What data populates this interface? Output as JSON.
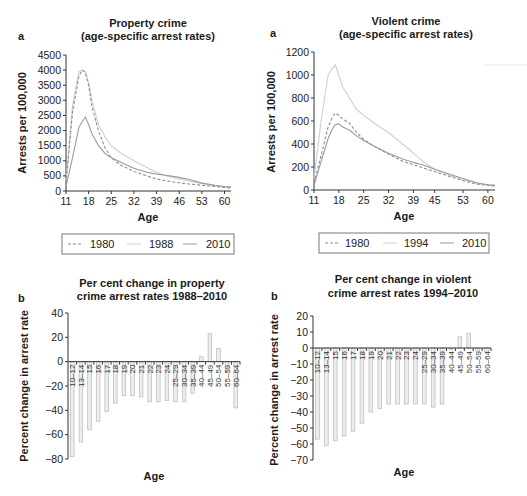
{
  "chart_data": [
    {
      "panel": "a",
      "type": "line",
      "title": "Property crime\n(age-specific arrest rates)",
      "title_lines": [
        "Property crime",
        "(age-specific arrest rates)"
      ],
      "xlabel": "Age",
      "ylabel": "Arrests per 100,000",
      "xlim": [
        11,
        62
      ],
      "ylim": [
        0,
        4500
      ],
      "xticks": [
        11,
        18,
        25,
        32,
        39,
        46,
        53,
        60
      ],
      "yticks": [
        0,
        500,
        1000,
        1500,
        2000,
        2500,
        3000,
        3500,
        4000,
        4500
      ],
      "grid": false,
      "legend_position": "bottom",
      "x": [
        11,
        13,
        15,
        16,
        17,
        18,
        19,
        21,
        23,
        25,
        28,
        32,
        36,
        39,
        42,
        46,
        49,
        53,
        57,
        60,
        62
      ],
      "series": [
        {
          "name": "1980",
          "style": "dashed",
          "color": "#8c8c8c",
          "values": [
            250,
            2600,
            3800,
            4000,
            3900,
            3500,
            2800,
            2000,
            1450,
            1100,
            850,
            650,
            500,
            400,
            330,
            270,
            230,
            190,
            150,
            120,
            100
          ]
        },
        {
          "name": "1988",
          "style": "solid-light",
          "color": "#c8c8c8",
          "values": [
            300,
            2800,
            3950,
            4000,
            3950,
            3600,
            3000,
            2200,
            1800,
            1500,
            1250,
            1000,
            780,
            620,
            500,
            400,
            330,
            250,
            180,
            140,
            120
          ]
        },
        {
          "name": "2010",
          "style": "solid",
          "color": "#9a9a9a",
          "values": [
            150,
            1100,
            2100,
            2300,
            2450,
            2200,
            1900,
            1500,
            1250,
            1100,
            950,
            750,
            620,
            560,
            520,
            450,
            380,
            260,
            190,
            150,
            130
          ]
        }
      ]
    },
    {
      "panel": "a",
      "type": "line",
      "title": "Violent crime\n(age-specific arrest rates)",
      "title_lines": [
        "Violent crime",
        "(age-specific arrest rates)"
      ],
      "xlabel": "Age",
      "ylabel": "Arrests per 100,000",
      "xlim": [
        11,
        62
      ],
      "ylim": [
        0,
        1200
      ],
      "xticks": [
        11,
        18,
        25,
        32,
        39,
        45,
        53,
        60
      ],
      "yticks": [
        0,
        200,
        400,
        600,
        800,
        1000,
        1200
      ],
      "grid": false,
      "legend_position": "bottom",
      "x": [
        11,
        13,
        15,
        16,
        17,
        18,
        19,
        21,
        23,
        25,
        28,
        32,
        36,
        39,
        42,
        45,
        49,
        53,
        57,
        60,
        62
      ],
      "series": [
        {
          "name": "1980",
          "style": "dashed",
          "color": "#8c8c8c",
          "values": [
            60,
            300,
            550,
            620,
            670,
            650,
            620,
            580,
            500,
            440,
            380,
            310,
            250,
            220,
            190,
            160,
            120,
            80,
            50,
            40,
            35
          ]
        },
        {
          "name": "1994",
          "style": "solid-light",
          "color": "#c8c8c8",
          "values": [
            100,
            600,
            1000,
            1050,
            1090,
            1000,
            900,
            800,
            700,
            650,
            580,
            500,
            400,
            320,
            240,
            180,
            130,
            90,
            60,
            45,
            40
          ]
        },
        {
          "name": "2010",
          "style": "solid",
          "color": "#9a9a9a",
          "values": [
            40,
            250,
            450,
            520,
            570,
            575,
            550,
            520,
            470,
            430,
            380,
            320,
            270,
            240,
            215,
            180,
            140,
            100,
            60,
            45,
            40
          ]
        }
      ]
    },
    {
      "panel": "b",
      "type": "bar",
      "title": "Per cent change in property\ncrime arrest rates 1988–2010",
      "title_lines": [
        "Per cent change in property",
        "crime arrest rates 1988–2010"
      ],
      "xlabel": "Age",
      "ylabel": "Percent change in arrest rate",
      "ylim": [
        -80,
        40
      ],
      "yticks": [
        -80,
        -60,
        -40,
        -20,
        0,
        20,
        40
      ],
      "grid": false,
      "categories": [
        "10–12",
        "13–14",
        "15",
        "16",
        "17",
        "18",
        "19",
        "20",
        "21",
        "22",
        "23",
        "24",
        "25–29",
        "30–34",
        "35–39",
        "40–44",
        "45–49",
        "50–54",
        "55–59",
        "60–64"
      ],
      "values": [
        -78,
        -66,
        -56,
        -49,
        -41,
        -34,
        -28,
        -28,
        -29,
        -33,
        -33,
        -32,
        -33,
        -33,
        -26,
        4,
        23,
        11,
        -8,
        -38
      ]
    },
    {
      "panel": "b",
      "type": "bar",
      "title": "Per cent change in violent\ncrime arrest rates 1994–2010",
      "title_lines": [
        "Per cent change in violent",
        "crime arrest rates 1994–2010"
      ],
      "xlabel": "Age",
      "ylabel": "Percent change in arrest rate",
      "ylim": [
        -70,
        20
      ],
      "yticks": [
        -70,
        -60,
        -50,
        -40,
        -30,
        -20,
        -10,
        0,
        10,
        20
      ],
      "grid": false,
      "categories": [
        "10–12",
        "13–14",
        "15",
        "16",
        "17",
        "18",
        "19",
        "20",
        "21",
        "22",
        "23",
        "24",
        "25–29",
        "30–34",
        "35–39",
        "40–44",
        "45–49",
        "50–54",
        "55–59",
        "60–64"
      ],
      "values": [
        -57,
        -61,
        -58,
        -55,
        -52,
        -47,
        -40,
        -38,
        -35,
        -35,
        -35,
        -35,
        -35,
        -37,
        -35,
        -1,
        7,
        9,
        -2,
        -2
      ]
    }
  ],
  "labels": {
    "panel_a": "a",
    "panel_b": "b",
    "age": "Age",
    "ylabel_a": "Arrests per 100,000",
    "ylabel_b": "Percent change in arrest rate"
  },
  "legends": [
    {
      "items": [
        "1980",
        "1988",
        "2010"
      ]
    },
    {
      "items": [
        "1980",
        "1994",
        "2010"
      ]
    }
  ],
  "colors": {
    "dashed": "#8c8c8c",
    "light": "#cfcfcf",
    "solid": "#9a9a9a",
    "bar_fill": "#ededed",
    "bar_stroke": "#b8b8b8",
    "axis": "#333333"
  }
}
